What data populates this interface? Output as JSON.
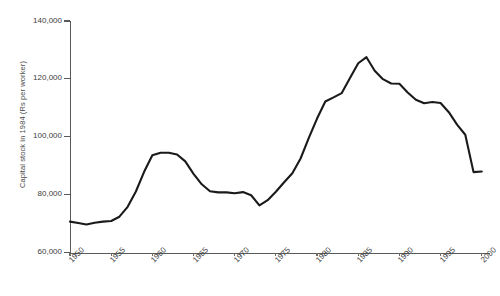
{
  "chart_data": {
    "type": "line",
    "title": "",
    "xlabel": "",
    "ylabel": "Capital stock in 1984 (Rs per worker)",
    "xlim": [
      1950,
      2001
    ],
    "ylim": [
      60000,
      140000
    ],
    "grid": false,
    "legend": "none",
    "xticks": [
      "1950",
      "1955",
      "1960",
      "1965",
      "1970",
      "1975",
      "1980",
      "1985",
      "1990",
      "1995",
      "2000"
    ],
    "xtick_values": [
      1950,
      1955,
      1960,
      1965,
      1970,
      1975,
      1980,
      1985,
      1990,
      1995,
      2000
    ],
    "yticks": [
      "60,000",
      "80,000",
      "100,000",
      "120,000",
      "140,000"
    ],
    "ytick_values": [
      60000,
      80000,
      100000,
      120000,
      140000
    ],
    "line_color": "#1a1a1a",
    "line_width": 2.1,
    "series": [
      {
        "name": "Capital stock per worker",
        "x": [
          1950,
          1951,
          1952,
          1953,
          1954,
          1955,
          1956,
          1957,
          1958,
          1959,
          1960,
          1961,
          1962,
          1963,
          1964,
          1965,
          1966,
          1967,
          1968,
          1969,
          1970,
          1971,
          1972,
          1973,
          1974,
          1975,
          1976,
          1977,
          1978,
          1979,
          1980,
          1981,
          1982,
          1983,
          1984,
          1985,
          1986,
          1987,
          1988,
          1989,
          1990,
          1991,
          1992,
          1993,
          1994,
          1995,
          1996,
          1997,
          1998,
          1999,
          2000
        ],
        "y": [
          70700,
          70200,
          69700,
          70300,
          70700,
          70900,
          72400,
          75800,
          81100,
          87900,
          93600,
          94500,
          94500,
          93900,
          91500,
          87200,
          83600,
          81200,
          80800,
          80800,
          80500,
          80900,
          79800,
          76300,
          78100,
          81000,
          84300,
          87400,
          92500,
          99600,
          106300,
          112200,
          113600,
          115100,
          120300,
          125400,
          127500,
          122800,
          119900,
          118400,
          118300,
          115300,
          112800,
          111600,
          112000,
          111700,
          108500,
          104200,
          100700,
          87800,
          88000
        ]
      }
    ],
    "annotations": [],
    "endpoint_value": 79500
  },
  "axis": {
    "y_title": "Capital stock in 1984 (Rs per worker)"
  }
}
